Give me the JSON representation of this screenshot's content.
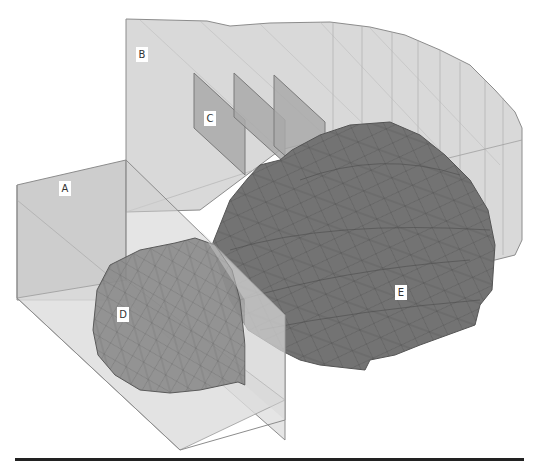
{
  "figure": {
    "labels": {
      "A": "A",
      "B": "B",
      "C": "C",
      "D": "D",
      "E": "E"
    },
    "colors": {
      "background": "#ffffff",
      "plane_B": "#d9d9d9",
      "box_A_front": "#bdbdbd",
      "box_A_floor": "#dcdcdc",
      "planes_C": "#a9a9a9",
      "mesh_D": "#8a8a8a",
      "mesh_E": "#737373",
      "edge": "#8c8c8c",
      "wire": "#4d4d4d",
      "baseline": "#222222"
    }
  }
}
